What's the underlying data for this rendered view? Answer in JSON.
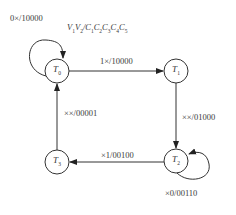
{
  "diagram": {
    "type": "state-transition",
    "header": {
      "text": "V1V2/C1C2C3C4C5",
      "parts": [
        {
          "base": "V",
          "sub": "1"
        },
        {
          "base": "V",
          "sub": "2"
        },
        {
          "base": "/C",
          "sub": "1"
        },
        {
          "base": "C",
          "sub": "2"
        },
        {
          "base": "C",
          "sub": "3"
        },
        {
          "base": "C",
          "sub": "4"
        },
        {
          "base": "C",
          "sub": "5"
        }
      ]
    },
    "nodes": [
      {
        "id": "T0",
        "base": "T",
        "sub": "0",
        "cx": 57,
        "cy": 71
      },
      {
        "id": "T1",
        "base": "T",
        "sub": "1",
        "cx": 176,
        "cy": 71
      },
      {
        "id": "T2",
        "base": "T",
        "sub": "2",
        "cx": 176,
        "cy": 161
      },
      {
        "id": "T3",
        "base": "T",
        "sub": "3",
        "cx": 57,
        "cy": 162
      }
    ],
    "edges": [
      {
        "from": "T0",
        "to": "T0",
        "label": "0×/10000"
      },
      {
        "from": "T0",
        "to": "T1",
        "label": "1×/10000"
      },
      {
        "from": "T1",
        "to": "T2",
        "label": "××/01000"
      },
      {
        "from": "T2",
        "to": "T2",
        "label": "×0/00110"
      },
      {
        "from": "T2",
        "to": "T3",
        "label": "×1/00100"
      },
      {
        "from": "T3",
        "to": "T0",
        "label": "××/00001"
      }
    ],
    "colors": {
      "stroke": "#333333",
      "background": "#ffffff"
    }
  }
}
